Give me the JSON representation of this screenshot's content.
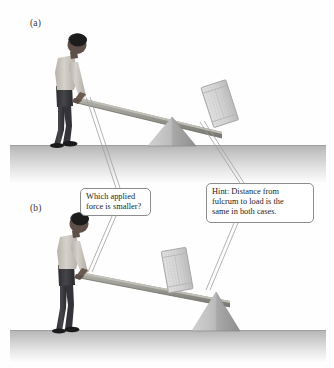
{
  "figure": {
    "background_color": "#fefefe",
    "panels": [
      {
        "id": "panel-a",
        "label": "(a)",
        "description": "Man pushing down on a long plank lever; fulcrum is near the middle-left, crate load rests at the far right end of the raised plank",
        "fulcrum_position": "middle",
        "load": "crate",
        "ground_color": "#b9b9b9"
      },
      {
        "id": "panel-b",
        "label": "(b)",
        "description": "Man pushing down on a long plank lever; fulcrum is far to the right, crate load rests on the plank just left of the fulcrum",
        "fulcrum_position": "right",
        "load": "crate",
        "ground_color": "#b9b9b9"
      }
    ]
  },
  "callouts": {
    "force_question": {
      "line1": "Which applied",
      "line2": "force is smaller?"
    },
    "hint": {
      "line1": "Hint: Distance from",
      "line2": "fulcrum to load is the",
      "line3": "same in both cases."
    }
  },
  "colors": {
    "plank": "#9a9a94",
    "plank_shadow": "#7d7d77",
    "fulcrum": "#bdbdbd",
    "fulcrum_dark": "#9c9c9c",
    "crate": "#d8d8d8",
    "crate_edge": "#a9a9a9",
    "person_shirt": "#cfcbc4",
    "person_pants": "#3b3b3e",
    "person_skin": "#5e5048",
    "person_hair": "#1c1c1c",
    "ground_top": "#b9b9b9",
    "leader_line": "#9a9a9a",
    "callout_border": "#8c8c8c",
    "text": "#1d1d1d"
  }
}
